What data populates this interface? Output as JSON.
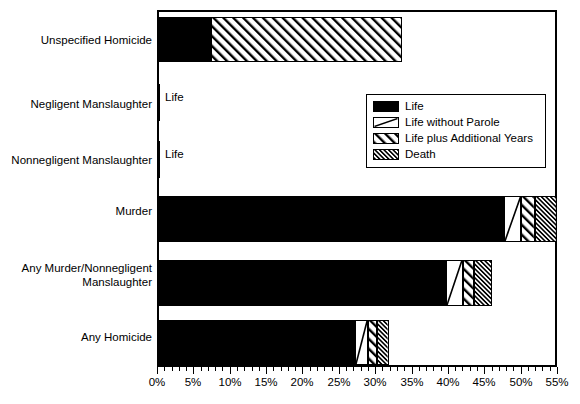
{
  "chart_data": {
    "type": "bar",
    "orientation": "horizontal",
    "stacked": true,
    "title": "",
    "xlabel": "",
    "ylabel": "",
    "xlim": [
      0,
      55
    ],
    "xtick_labels": [
      "0%",
      "5%",
      "10%",
      "15%",
      "20%",
      "25%",
      "30%",
      "35%",
      "40%",
      "45%",
      "50%",
      "55%"
    ],
    "xtick_values": [
      0,
      5,
      10,
      15,
      20,
      25,
      30,
      35,
      40,
      45,
      50,
      55
    ],
    "minor_tick_step": 1,
    "grid": false,
    "legend_position": "upper right inside plot",
    "categories": [
      "Unspecified Homicide",
      "Negligent Manslaughter",
      "Nonnegligent Manslaughter",
      "Murder",
      "Any Murder/Nonnegligent\nManslaughter",
      "Any Homicide"
    ],
    "series": [
      {
        "name": "Life",
        "pattern": "solid-black",
        "values": [
          7.4,
          0.4,
          0.4,
          47.7,
          39.8,
          27.2
        ]
      },
      {
        "name": "Life without Parole",
        "pattern": "single-diagonal",
        "values": [
          0.0,
          0.0,
          0.0,
          2.4,
          2.3,
          1.8
        ]
      },
      {
        "name": "Life plus Additional Years",
        "pattern": "diagonal-hatch",
        "values": [
          26.3,
          0.0,
          0.0,
          1.9,
          1.5,
          1.3
        ]
      },
      {
        "name": "Death",
        "pattern": "dense-hatch",
        "values": [
          0.0,
          0.0,
          0.0,
          3.0,
          2.5,
          1.6
        ]
      }
    ],
    "totals": [
      33.7,
      0.4,
      0.4,
      55.0,
      46.1,
      31.9
    ],
    "annotations": [
      {
        "text": "Life",
        "category": "Negligent Manslaughter",
        "x": 1.0
      },
      {
        "text": "Life",
        "category": "Nonnegligent Manslaughter",
        "x": 1.0
      }
    ]
  },
  "legend": {
    "items": [
      {
        "label": "Life"
      },
      {
        "label": "Life without Parole"
      },
      {
        "label": "Life plus Additional Years"
      },
      {
        "label": "Death"
      }
    ]
  },
  "colors": {
    "axis": "#000000",
    "bar_fill_primary": "#000000",
    "bar_fill_secondary": "#ffffff",
    "background": "#ffffff"
  }
}
